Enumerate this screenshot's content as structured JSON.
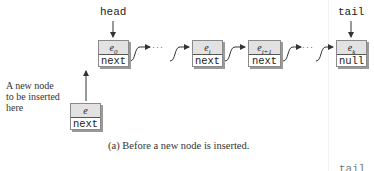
{
  "diagram": {
    "type": "linked-list-insertion",
    "pointers": {
      "head": "head",
      "tail": "tail",
      "tail_clipped": "tail"
    },
    "nodes": [
      {
        "id": "e0",
        "element": "e",
        "subscript": "0",
        "next": "next"
      },
      {
        "id": "ei",
        "element": "e",
        "subscript": "i",
        "next": "next"
      },
      {
        "id": "ei1",
        "element": "e",
        "subscript": "i+1",
        "next": "next"
      },
      {
        "id": "ek",
        "element": "e",
        "subscript": "k",
        "next": "null"
      }
    ],
    "new_node": {
      "element": "e",
      "next": "next"
    },
    "ellipsis": "···",
    "new_node_label": [
      "A new node",
      "to be inserted",
      "here"
    ],
    "caption": "(a) Before a new node is inserted."
  },
  "colors": {
    "node_top": "#e2e2e2",
    "node_border": "#8a8a8a",
    "arrow": "#333333",
    "text": "#222222"
  }
}
